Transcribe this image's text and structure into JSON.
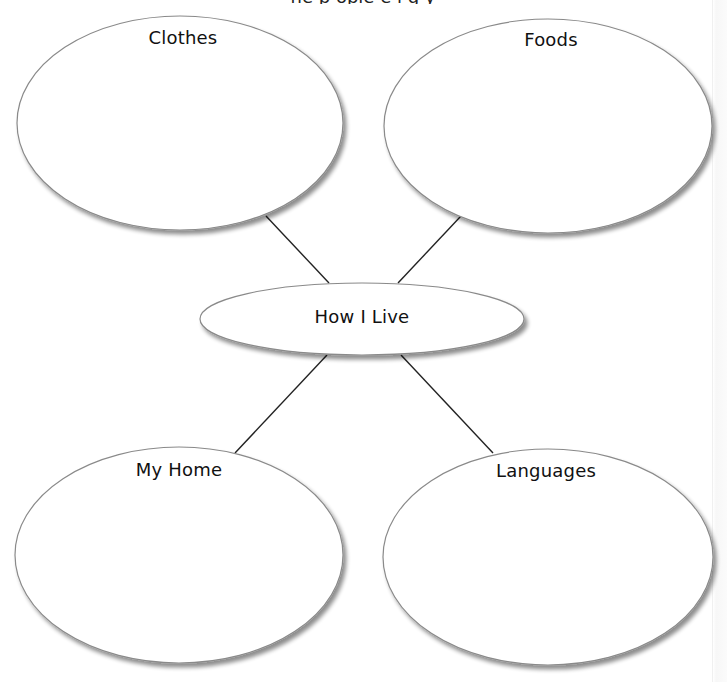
{
  "header": {
    "clipped_text": "ne   p  ople   e   i g  y"
  },
  "diagram": {
    "type": "concept-map",
    "center": {
      "label": "How I Live",
      "cx": 362,
      "cy": 319,
      "rx": 162,
      "ry": 36
    },
    "nodes": [
      {
        "id": "clothes",
        "label": "Clothes",
        "cx": 180,
        "cy": 123,
        "rx": 163,
        "ry": 107
      },
      {
        "id": "foods",
        "label": "Foods",
        "cx": 548,
        "cy": 126,
        "rx": 164,
        "ry": 107
      },
      {
        "id": "my-home",
        "label": "My Home",
        "cx": 179,
        "cy": 555,
        "rx": 164,
        "ry": 108
      },
      {
        "id": "languages",
        "label": "Languages",
        "cx": 548,
        "cy": 557,
        "rx": 165,
        "ry": 108
      }
    ],
    "connectors": [
      {
        "from": "clothes",
        "to": "center",
        "x1": 266,
        "y1": 216,
        "x2": 329,
        "y2": 283
      },
      {
        "from": "foods",
        "to": "center",
        "x1": 461,
        "y1": 216,
        "x2": 398,
        "y2": 283
      },
      {
        "from": "center",
        "to": "my-home",
        "x1": 327,
        "y1": 355,
        "x2": 235,
        "y2": 453
      },
      {
        "from": "center",
        "to": "languages",
        "x1": 401,
        "y1": 355,
        "x2": 493,
        "y2": 453
      }
    ],
    "colors": {
      "ellipse_stroke": "#8a8a8a",
      "ellipse_fill": "#ffffff",
      "shadow": "#9a9a9a",
      "connector": "#222222",
      "label": "#111111"
    }
  }
}
